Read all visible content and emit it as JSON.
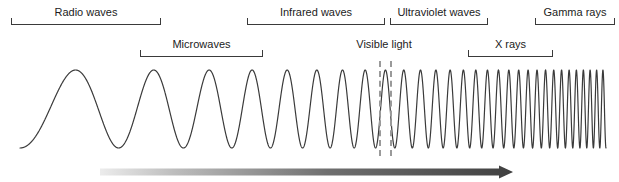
{
  "figure": {
    "width": 619,
    "height": 182,
    "background": "#ffffff",
    "line_color": "#3a3a3a",
    "text_color": "#1c1c1c",
    "dash_color": "#9a9a9a"
  },
  "bands_row_top": [
    {
      "label": "Radio waves",
      "x1": 11,
      "x2": 161,
      "y": 18
    },
    {
      "label": "Infrared waves",
      "x1": 247,
      "x2": 385,
      "y": 18
    },
    {
      "label": "Ultraviolet waves",
      "x1": 390,
      "x2": 488,
      "y": 18
    },
    {
      "label": "Gamma rays",
      "x1": 535,
      "x2": 615,
      "y": 18
    }
  ],
  "bands_row_second": [
    {
      "label": "Microwaves",
      "x1": 140,
      "x2": 263,
      "y": 50
    },
    {
      "label": "X rays",
      "x1": 468,
      "x2": 553,
      "y": 50
    }
  ],
  "visible_light": {
    "label": "Visible light",
    "label_center_x": 384,
    "label_y": 50,
    "dash_x1": 379,
    "dash_x2": 390,
    "dash_top": 61,
    "dash_bottom": 156
  },
  "arrow": {
    "name": "increasing-frequency-arrow",
    "x_start": 100,
    "x_end": 513,
    "y": 172,
    "thickness": 7,
    "color_start": "#e2e2e2",
    "color_end": "#4a4a4a"
  },
  "chart_data": {
    "type": "line",
    "xlabel": "",
    "ylabel": "",
    "wave": {
      "x_start": 20,
      "x_end": 606,
      "center_y": 109,
      "amplitude": 39,
      "stroke": "#3a3a3a",
      "stroke_width": 1.2,
      "cycles_total": 30,
      "frequency_growth": "exponential"
    },
    "categories": [
      "Radio waves",
      "Microwaves",
      "Infrared waves",
      "Visible light",
      "Ultraviolet waves",
      "X rays",
      "Gamma rays"
    ],
    "band_extents_px": [
      [
        11,
        161
      ],
      [
        140,
        263
      ],
      [
        247,
        385
      ],
      [
        379,
        390
      ],
      [
        390,
        488
      ],
      [
        468,
        553
      ],
      [
        535,
        615
      ]
    ],
    "legend": "none",
    "grid": false
  }
}
